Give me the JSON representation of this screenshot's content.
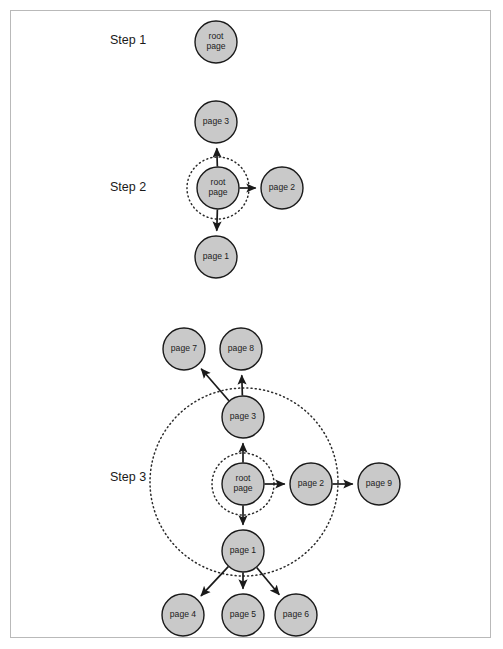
{
  "figure": {
    "background_color": "#ffffff",
    "border_color": "#b9b9b9",
    "node_fill": "#c9c9c9",
    "node_stroke": "#1a1a1a",
    "ring_stroke": "#2b2b2b",
    "edge_stroke": "#1a1a1a"
  },
  "steps": [
    {
      "id": "step1",
      "label": "Step 1",
      "label_x": 110,
      "label_y": 41
    },
    {
      "id": "step2",
      "label": "Step 2",
      "label_x": 110,
      "label_y": 188
    },
    {
      "id": "step3",
      "label": "Step 3",
      "label_x": 110,
      "label_y": 478
    }
  ],
  "nodes": [
    {
      "id": "s1-root",
      "step": "step1",
      "label": "root page",
      "lines": [
        "root",
        "page"
      ],
      "cx": 216,
      "cy": 42,
      "r": 21
    },
    {
      "id": "s2-page3",
      "step": "step2",
      "label": "page 3",
      "lines": [
        "page 3"
      ],
      "cx": 216,
      "cy": 122,
      "r": 21
    },
    {
      "id": "s2-root",
      "step": "step2",
      "label": "root page",
      "lines": [
        "root",
        "page"
      ],
      "cx": 218,
      "cy": 188,
      "r": 21
    },
    {
      "id": "s2-page2",
      "step": "step2",
      "label": "page 2",
      "lines": [
        "page 2"
      ],
      "cx": 282,
      "cy": 188,
      "r": 21
    },
    {
      "id": "s2-page1",
      "step": "step2",
      "label": "page 1",
      "lines": [
        "page 1"
      ],
      "cx": 216,
      "cy": 257,
      "r": 21
    },
    {
      "id": "s3-page7",
      "step": "step3",
      "label": "page 7",
      "lines": [
        "page 7"
      ],
      "cx": 184,
      "cy": 349,
      "r": 21
    },
    {
      "id": "s3-page8",
      "step": "step3",
      "label": "page 8",
      "lines": [
        "page 8"
      ],
      "cx": 241,
      "cy": 349,
      "r": 21
    },
    {
      "id": "s3-page3",
      "step": "step3",
      "label": "page 3",
      "lines": [
        "page 3"
      ],
      "cx": 243,
      "cy": 417,
      "r": 21
    },
    {
      "id": "s3-root",
      "step": "step3",
      "label": "root page",
      "lines": [
        "root",
        "page"
      ],
      "cx": 243,
      "cy": 484,
      "r": 21
    },
    {
      "id": "s3-page2",
      "step": "step3",
      "label": "page 2",
      "lines": [
        "page 2"
      ],
      "cx": 311,
      "cy": 484,
      "r": 21
    },
    {
      "id": "s3-page9",
      "step": "step3",
      "label": "page 9",
      "lines": [
        "page 9"
      ],
      "cx": 379,
      "cy": 484,
      "r": 21
    },
    {
      "id": "s3-page1",
      "step": "step3",
      "label": "page 1",
      "lines": [
        "page 1"
      ],
      "cx": 243,
      "cy": 551,
      "r": 21
    },
    {
      "id": "s3-page4",
      "step": "step3",
      "label": "page 4",
      "lines": [
        "page 4"
      ],
      "cx": 183,
      "cy": 615,
      "r": 21
    },
    {
      "id": "s3-page5",
      "step": "step3",
      "label": "page 5",
      "lines": [
        "page 5"
      ],
      "cx": 243,
      "cy": 615,
      "r": 21
    },
    {
      "id": "s3-page6",
      "step": "step3",
      "label": "page 6",
      "lines": [
        "page 6"
      ],
      "cx": 296,
      "cy": 615,
      "r": 21
    }
  ],
  "rings": [
    {
      "id": "s2-ring-root",
      "step": "step2",
      "cx": 218,
      "cy": 188,
      "r": 31
    },
    {
      "id": "s3-ring-root",
      "step": "step3",
      "cx": 243,
      "cy": 484,
      "r": 31
    },
    {
      "id": "s3-ring-outer",
      "step": "step3",
      "cx": 244,
      "cy": 482,
      "r": 94
    }
  ],
  "edges": [
    {
      "id": "s2-root-to-page3",
      "step": "step2",
      "from": "s2-root",
      "to": "s2-page3"
    },
    {
      "id": "s2-root-to-page2",
      "step": "step2",
      "from": "s2-root",
      "to": "s2-page2"
    },
    {
      "id": "s2-root-to-page1",
      "step": "step2",
      "from": "s2-root",
      "to": "s2-page1"
    },
    {
      "id": "s3-root-to-page3",
      "step": "step3",
      "from": "s3-root",
      "to": "s3-page3"
    },
    {
      "id": "s3-root-to-page2",
      "step": "step3",
      "from": "s3-root",
      "to": "s3-page2"
    },
    {
      "id": "s3-root-to-page1",
      "step": "step3",
      "from": "s3-root",
      "to": "s3-page1"
    },
    {
      "id": "s3-page3-to-page7",
      "step": "step3",
      "from": "s3-page3",
      "to": "s3-page7"
    },
    {
      "id": "s3-page3-to-page8",
      "step": "step3",
      "from": "s3-page3",
      "to": "s3-page8"
    },
    {
      "id": "s3-page2-to-page9",
      "step": "step3",
      "from": "s3-page2",
      "to": "s3-page9"
    },
    {
      "id": "s3-page1-to-page4",
      "step": "step3",
      "from": "s3-page1",
      "to": "s3-page4"
    },
    {
      "id": "s3-page1-to-page5",
      "step": "step3",
      "from": "s3-page1",
      "to": "s3-page5"
    },
    {
      "id": "s3-page1-to-page6",
      "step": "step3",
      "from": "s3-page1",
      "to": "s3-page6"
    }
  ]
}
